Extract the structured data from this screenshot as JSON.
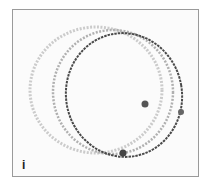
{
  "figure": {
    "panel_label": "i",
    "colors": {
      "frame": "#9a9a9a",
      "background": "#fbfbfb",
      "bangle_light": "#c4c4c4",
      "bangle_mid": "#a8a8a8",
      "bangle_dark": "#4a4a4a"
    }
  }
}
